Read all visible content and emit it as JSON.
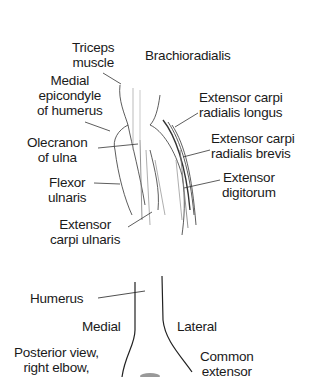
{
  "top_figure": {
    "labels": {
      "triceps": [
        "Triceps",
        "muscle"
      ],
      "brachioradialis": [
        "Brachioradialis"
      ],
      "medial_epicondyle": [
        "Medial",
        "epicondyle",
        "of humerus"
      ],
      "ecrl": [
        "Extensor carpi",
        "radialis longus"
      ],
      "olecranon": [
        "Olecranon",
        "of ulna"
      ],
      "ecrb": [
        "Extensor carpi",
        "radialis brevis"
      ],
      "flexor_ulnaris": [
        "Flexor",
        "ulnaris"
      ],
      "extensor_digitorum": [
        "Extensor",
        "digitorum"
      ],
      "ecu": [
        "Extensor",
        "carpi ulnaris"
      ]
    }
  },
  "bottom_figure": {
    "labels": {
      "humerus": [
        "Humerus"
      ],
      "medial": [
        "Medial"
      ],
      "lateral": [
        "Lateral"
      ],
      "view": [
        "Posterior view,",
        "right elbow,"
      ],
      "common_extensor": [
        "Common",
        "extensor"
      ]
    }
  },
  "colors": {
    "ink": "#1a1a1a",
    "background": "#ffffff"
  }
}
